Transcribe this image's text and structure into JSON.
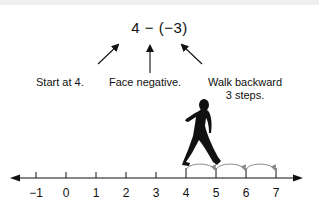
{
  "expression": "4 − (−3)",
  "annotations": [
    {
      "id": "start",
      "text": "Start at 4."
    },
    {
      "id": "face",
      "text": "Face negative."
    },
    {
      "id": "walk",
      "line1": "Walk backward",
      "line2": "3 steps."
    }
  ],
  "number_line": {
    "ticks": [
      "−1",
      "0",
      "1",
      "2",
      "3",
      "4",
      "5",
      "6",
      "7"
    ],
    "start_value": 4,
    "end_value": 7,
    "steps": 3
  },
  "colors": {
    "ink": "#111111",
    "arc": "#8a8a8a",
    "background": "#ffffff"
  }
}
